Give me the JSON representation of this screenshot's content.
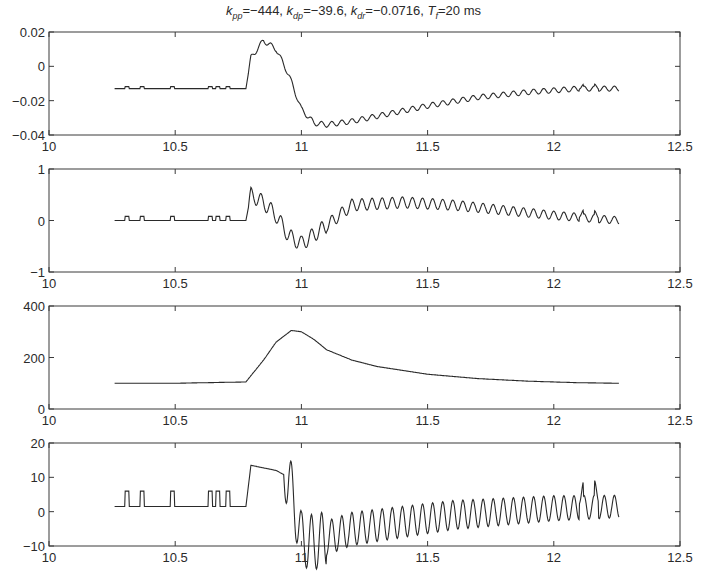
{
  "figure": {
    "title_parts": [
      {
        "sym": "k",
        "sub": "pp",
        "val": "=−444, "
      },
      {
        "sym": "k",
        "sub": "dp",
        "val": "=−39.6, "
      },
      {
        "sym": "k",
        "sub": "dr",
        "val": "=−0.0716, "
      },
      {
        "sym": "T",
        "sub": "f",
        "val": "=20 ms"
      }
    ],
    "line_color": "#2a2a2a",
    "axes_color": "#3a3a3a"
  },
  "chart_data": [
    {
      "type": "line",
      "title": "k_pp=-444, k_dp=-39.6, k_dr=-0.0716, T_f=20 ms",
      "xlabel": "",
      "ylabel": "",
      "xlim": [
        10,
        12.5
      ],
      "ylim": [
        -0.04,
        0.02
      ],
      "xticks": [
        "10",
        "10.5",
        "11",
        "11.5",
        "12",
        "12.5"
      ],
      "yticks": [
        "-0.04",
        "-0.02",
        "0",
        "0.02"
      ],
      "series": [
        {
          "name": "panel1",
          "x": [
            10.26,
            10.3,
            10.4,
            10.5,
            10.6,
            10.78,
            10.8,
            10.85,
            10.9,
            10.95,
            11.0,
            11.05,
            11.1,
            11.2,
            11.3,
            11.5,
            11.7,
            11.9,
            12.1,
            12.26
          ],
          "y": [
            -0.013,
            -0.013,
            -0.013,
            -0.013,
            -0.013,
            -0.013,
            0.005,
            0.015,
            0.01,
            -0.005,
            -0.025,
            -0.033,
            -0.034,
            -0.032,
            -0.029,
            -0.023,
            -0.018,
            -0.015,
            -0.013,
            -0.013
          ]
        }
      ],
      "grid": false
    },
    {
      "type": "line",
      "xlim": [
        10,
        12.5
      ],
      "ylim": [
        -1,
        1
      ],
      "xticks": [
        "10",
        "10.5",
        "11",
        "11.5",
        "12",
        "12.5"
      ],
      "yticks": [
        "-1",
        "0",
        "1"
      ],
      "series": [
        {
          "name": "panel2",
          "x": [
            10.26,
            10.78,
            10.8,
            10.85,
            10.9,
            10.95,
            11.0,
            11.1,
            11.2,
            11.4,
            11.6,
            11.8,
            12.0,
            12.26
          ],
          "y": [
            0,
            0,
            0.5,
            0.35,
            0.1,
            -0.3,
            -0.45,
            -0.1,
            0.3,
            0.35,
            0.3,
            0.2,
            0.1,
            0
          ]
        }
      ],
      "grid": false
    },
    {
      "type": "line",
      "xlim": [
        10,
        12.5
      ],
      "ylim": [
        0,
        400
      ],
      "xticks": [
        "10",
        "10.5",
        "11",
        "11.5",
        "12",
        "12.5"
      ],
      "yticks": [
        "0",
        "200",
        "400"
      ],
      "series": [
        {
          "name": "panel3",
          "x": [
            10.26,
            10.5,
            10.78,
            10.85,
            10.9,
            10.96,
            11.0,
            11.05,
            11.1,
            11.2,
            11.3,
            11.5,
            11.7,
            11.9,
            12.1,
            12.26
          ],
          "y": [
            100,
            100,
            105,
            190,
            260,
            305,
            300,
            270,
            230,
            190,
            165,
            135,
            118,
            108,
            102,
            100
          ]
        }
      ],
      "grid": false
    },
    {
      "type": "line",
      "xlim": [
        10,
        12.5
      ],
      "ylim": [
        -10,
        20
      ],
      "xticks": [
        "10",
        "10.5",
        "11",
        "11.5",
        "12",
        "12.5"
      ],
      "yticks": [
        "-10",
        "0",
        "10",
        "20"
      ],
      "series": [
        {
          "name": "panel4",
          "x": [
            10.26,
            10.78,
            10.8,
            10.9,
            10.95,
            11.0,
            11.05,
            11.2,
            11.4,
            11.6,
            11.8,
            12.0,
            12.26
          ],
          "y": [
            1.5,
            1.5,
            13.5,
            12,
            10,
            -8,
            -9,
            -5,
            -3,
            -1,
            0,
            1,
            1.5
          ]
        }
      ],
      "grid": false
    }
  ]
}
